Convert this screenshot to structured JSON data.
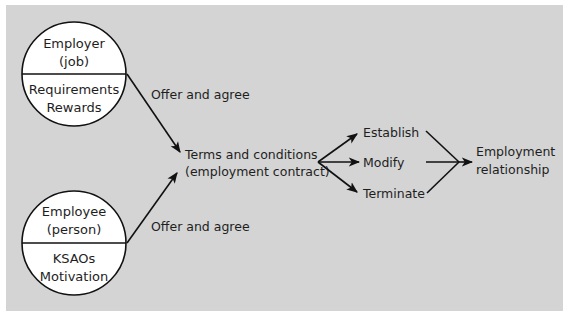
{
  "diagram": {
    "background_color": "#d4d4d4",
    "employer": {
      "title_line1": "Employer",
      "title_line2": "(job)",
      "detail_line1": "Requirements",
      "detail_line2": "Rewards"
    },
    "employee": {
      "title_line1": "Employee",
      "title_line2": "(person)",
      "detail_line1": "KSAOs",
      "detail_line2": "Motivation"
    },
    "offer_top": "Offer and agree",
    "offer_bottom": "Offer and agree",
    "terms": {
      "line1": "Terms and conditions",
      "line2": "(employment contract)"
    },
    "actions": [
      "Establish",
      "Modify",
      "Terminate"
    ],
    "result": {
      "line1": "Employment",
      "line2": "relationship"
    }
  }
}
